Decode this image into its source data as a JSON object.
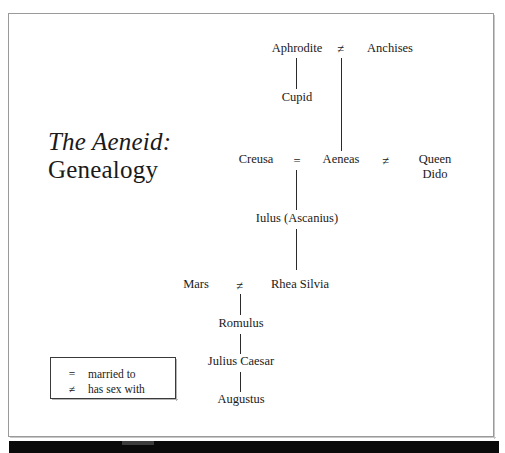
{
  "slide": {
    "title_line1": "The Aeneid:",
    "title_line2": "Genealogy",
    "background_color": "#ffffff",
    "frame_border_color": "#9a9a9a",
    "text_color": "#1a1a1a",
    "bottom_bar_color": "#0a0a0a"
  },
  "diagram": {
    "type": "genealogy-tree",
    "nodes": [
      {
        "id": "aphrodite",
        "label": "Aphrodite"
      },
      {
        "id": "anchises",
        "label": "Anchises"
      },
      {
        "id": "cupid",
        "label": "Cupid"
      },
      {
        "id": "creusa",
        "label": "Creusa"
      },
      {
        "id": "aeneas",
        "label": "Aeneas"
      },
      {
        "id": "queen_dido",
        "label": "Queen Dido"
      },
      {
        "id": "iulus",
        "label": "Iulus (Ascanius)"
      },
      {
        "id": "mars",
        "label": "Mars"
      },
      {
        "id": "rhea_silvia",
        "label": "Rhea Silvia"
      },
      {
        "id": "romulus",
        "label": "Romulus"
      },
      {
        "id": "julius_caesar",
        "label": "Julius Caesar"
      },
      {
        "id": "augustus",
        "label": "Augustus"
      }
    ],
    "relations": [
      {
        "from": "aphrodite",
        "to": "anchises",
        "symbol": "≠",
        "meaning": "has sex with"
      },
      {
        "from": "creusa",
        "to": "aeneas",
        "symbol": "=",
        "meaning": "married to"
      },
      {
        "from": "aeneas",
        "to": "queen_dido",
        "symbol": "≠",
        "meaning": "has sex with"
      },
      {
        "from": "mars",
        "to": "rhea_silvia",
        "symbol": "≠",
        "meaning": "has sex with"
      }
    ],
    "descents": [
      {
        "parent": "aphrodite",
        "child": "cupid"
      },
      {
        "parent": "aphrodite_anchises",
        "child": "aeneas"
      },
      {
        "parent": "creusa_aeneas",
        "child": "iulus"
      },
      {
        "parent": "iulus",
        "child": "rhea_silvia"
      },
      {
        "parent": "mars_rhea_silvia",
        "child": "romulus"
      },
      {
        "parent": "romulus",
        "child": "julius_caesar"
      },
      {
        "parent": "julius_caesar",
        "child": "augustus"
      }
    ],
    "symbols": {
      "aphrodite_anchises": "≠",
      "creusa_aeneas": "=",
      "aeneas_dido": "≠",
      "mars_rhea": "≠"
    },
    "queen_dido_line1": "Queen",
    "queen_dido_line2": "Dido"
  },
  "legend": {
    "rows": [
      {
        "symbol": "=",
        "text": "married to"
      },
      {
        "symbol": "≠",
        "text": "has sex with"
      }
    ]
  }
}
